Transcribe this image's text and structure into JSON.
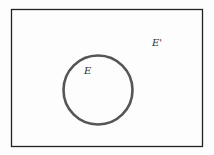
{
  "diagram": {
    "type": "venn",
    "universe": {
      "label": "E'",
      "border_color": "#222222"
    },
    "set": {
      "label": "E",
      "stroke_color": "#555555"
    }
  }
}
